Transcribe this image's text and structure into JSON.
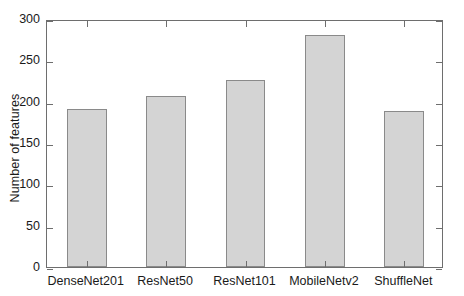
{
  "chart_data": {
    "type": "bar",
    "title": "",
    "xlabel": "",
    "ylabel": "Number of features",
    "categories": [
      "DenseNet201",
      "ResNet50",
      "ResNet101",
      "MobileNetv2",
      "ShuffleNet"
    ],
    "values": [
      191,
      207,
      226,
      281,
      189
    ],
    "ylim": [
      0,
      300
    ],
    "yticks": [
      0,
      50,
      100,
      150,
      200,
      250,
      300
    ],
    "ytick_labels": [
      "0",
      "50",
      "100",
      "150",
      "200",
      "250",
      "300"
    ],
    "grid": false,
    "legend": null,
    "bar_color": "#d4d4d4",
    "bar_edge_color": "#8a8a8a",
    "axis_color": "#6e6e6e",
    "background_color": "#ffffff"
  }
}
